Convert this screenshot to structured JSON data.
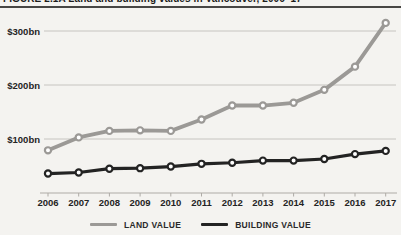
{
  "figure": {
    "title": "FIGURE 2.1A  Land and building values in Vancouver, 2006–17"
  },
  "chart_data": {
    "type": "line",
    "title": "Land and building values in Vancouver, 2006–17",
    "x": [
      2006,
      2007,
      2008,
      2009,
      2010,
      2011,
      2012,
      2013,
      2014,
      2015,
      2016,
      2017
    ],
    "series": [
      {
        "name": "LAND VALUE",
        "color": "#9b9996",
        "values_bn": [
          79,
          103,
          115,
          116,
          115,
          136,
          162,
          162,
          167,
          191,
          234,
          315
        ]
      },
      {
        "name": "BUILDING VALUE",
        "color": "#232323",
        "values_bn": [
          36,
          38,
          45,
          46,
          49,
          54,
          56,
          60,
          60,
          63,
          72,
          78
        ]
      }
    ],
    "unit": "$bn",
    "ylim": [
      0,
      330
    ],
    "yticks": [
      {
        "value": 100,
        "label": "$100bn"
      },
      {
        "value": 200,
        "label": "$200bn"
      },
      {
        "value": 300,
        "label": "$300bn"
      }
    ],
    "grid": true,
    "legend_position": "bottom",
    "marker_style": "open-circle-white-fill"
  },
  "colors": {
    "background": "#f4f3f0",
    "gridline": "#c6c4c0",
    "axis": "#aeaba6",
    "tick_text": "#242424",
    "marker_fill": "#ffffff",
    "title_rule": "#474644"
  }
}
